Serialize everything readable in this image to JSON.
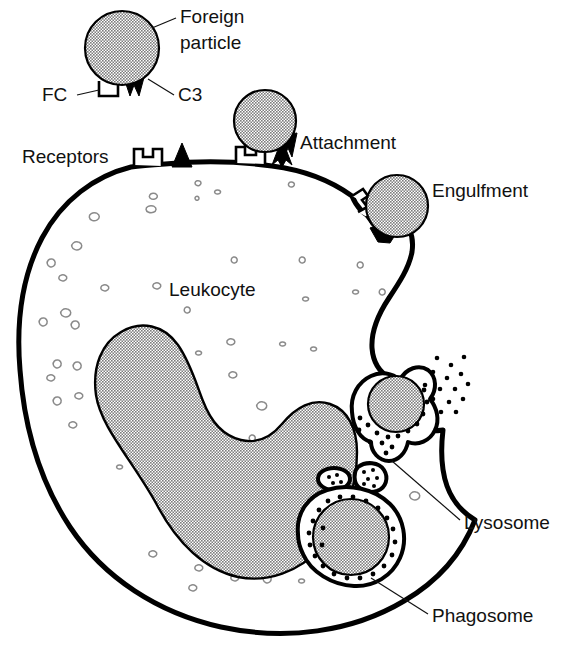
{
  "figure": {
    "width": 579,
    "height": 649,
    "background_color": "#ffffff"
  },
  "colors": {
    "particle_fill": "#a9a9a9",
    "nucleus_fill": "#a9a9a9",
    "outline": "#000000",
    "text": "#111111",
    "cytoplasm_fill": "#ffffff",
    "granule": "#000000",
    "cyto_granule_stroke": "#8a8a8a"
  },
  "labels": {
    "foreign_particle_line1": "Foreign",
    "foreign_particle_line2": "particle",
    "fc": "FC",
    "c3": "C3",
    "receptors": "Receptors",
    "attachment": "Attachment",
    "engulfment": "Engulfment",
    "leukocyte": "Leukocyte",
    "lysosome": "Lysosome",
    "phagosome": "Phagosome"
  },
  "stages": [
    {
      "id": "free-particle",
      "label": "Foreign particle",
      "description": "Opsonized particle bearing FC and C3 ligands, free outside the cell"
    },
    {
      "id": "attachment",
      "label": "Attachment",
      "description": "Particle ligands bind membrane FC and C3 receptors"
    },
    {
      "id": "engulfment",
      "label": "Engulfment",
      "description": "Pseudopods extend around the bound particle"
    },
    {
      "id": "lysosome-fusion",
      "label": "Lysosome",
      "description": "Lysosome granules fuse with the internalized vesicle and degranulate"
    },
    {
      "id": "phagosome",
      "label": "Phagosome",
      "description": "Particle enclosed in a granule-lined phagosome"
    }
  ],
  "structures": {
    "cell": "Leukocyte",
    "nucleus": "Nucleus",
    "receptor_fc": "FC receptor",
    "receptor_c3": "C3 receptor",
    "free_lysosomes_count": 3
  }
}
